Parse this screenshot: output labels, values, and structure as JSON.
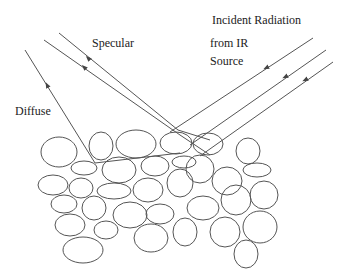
{
  "labels": {
    "specular": "Specular",
    "diffuse": "Diffuse",
    "incident_line1": "Incident Radiation",
    "incident_line2": "from IR",
    "incident_line3": "Source"
  },
  "colors": {
    "stroke": "#555555",
    "text": "#222222"
  }
}
